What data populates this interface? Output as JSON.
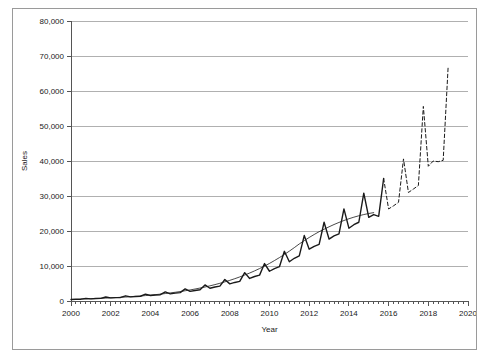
{
  "chart_data": {
    "type": "line",
    "title": "",
    "xlabel": "Year",
    "ylabel": "Sales",
    "xlim": [
      2000,
      2020
    ],
    "ylim": [
      0,
      80000
    ],
    "grid": true,
    "legend_position": "bottom",
    "x_ticks": [
      "2000",
      "2002",
      "2004",
      "2006",
      "2008",
      "2010",
      "2012",
      "2014",
      "2016",
      "2018",
      "2020"
    ],
    "x_tick_values": [
      2000,
      2002,
      2004,
      2006,
      2008,
      2010,
      2012,
      2014,
      2016,
      2018,
      2020
    ],
    "y_ticks": [
      "0",
      "10,000",
      "20,000",
      "30,000",
      "40,000",
      "50,000",
      "60,000",
      "70,000",
      "80,000"
    ],
    "y_tick_values": [
      0,
      10000,
      20000,
      30000,
      40000,
      50000,
      60000,
      70000,
      80000
    ],
    "minor_x_tick_step": 0.25,
    "series": [
      {
        "name": "Sales",
        "style": "solid",
        "width": 1.4,
        "color": "#1a1a1a",
        "x": [
          2000,
          2000.25,
          2000.5,
          2000.75,
          2001,
          2001.25,
          2001.5,
          2001.75,
          2002,
          2002.25,
          2002.5,
          2002.75,
          2003,
          2003.25,
          2003.5,
          2003.75,
          2004,
          2004.25,
          2004.5,
          2004.75,
          2005,
          2005.25,
          2005.5,
          2005.75,
          2006,
          2006.25,
          2006.5,
          2006.75,
          2007,
          2007.25,
          2007.5,
          2007.75,
          2008,
          2008.25,
          2008.5,
          2008.75,
          2009,
          2009.25,
          2009.5,
          2009.75,
          2010,
          2010.25,
          2010.5,
          2010.75,
          2011,
          2011.25,
          2011.5,
          2011.75,
          2012,
          2012.25,
          2012.5,
          2012.75,
          2013,
          2013.25,
          2013.5,
          2013.75,
          2014,
          2014.25,
          2014.5,
          2014.75,
          2015,
          2015.25,
          2015.5,
          2015.75
        ],
        "values": [
          420,
          480,
          520,
          760,
          600,
          700,
          760,
          1150,
          880,
          960,
          1020,
          1480,
          1180,
          1280,
          1360,
          1950,
          1560,
          1700,
          1800,
          2600,
          2050,
          2250,
          2400,
          3450,
          2750,
          3000,
          3200,
          4600,
          3650,
          4000,
          4250,
          6150,
          4900,
          5300,
          5600,
          8100,
          6450,
          7000,
          7400,
          10700,
          8500,
          9250,
          9800,
          14200,
          11200,
          12200,
          12900,
          18700,
          14800,
          15600,
          16200,
          22500,
          17700,
          18600,
          19200,
          26300,
          20800,
          21800,
          22500,
          30800,
          23900,
          24700,
          24200,
          35000
        ]
      },
      {
        "name": "CMA",
        "style": "solid",
        "width": 0.8,
        "color": "#1a1a1a",
        "x": [
          2000.5,
          2000.75,
          2001,
          2001.25,
          2001.5,
          2001.75,
          2002,
          2002.25,
          2002.5,
          2002.75,
          2003,
          2003.25,
          2003.5,
          2003.75,
          2004,
          2004.25,
          2004.5,
          2004.75,
          2005,
          2005.25,
          2005.5,
          2005.75,
          2006,
          2006.25,
          2006.5,
          2006.75,
          2007,
          2007.25,
          2007.5,
          2007.75,
          2008,
          2008.25,
          2008.5,
          2008.75,
          2009,
          2009.25,
          2009.5,
          2009.75,
          2010,
          2010.25,
          2010.5,
          2010.75,
          2011,
          2011.25,
          2011.5,
          2011.75,
          2012,
          2012.25,
          2012.5,
          2012.75,
          2013,
          2013.25,
          2013.5,
          2013.75,
          2014,
          2014.25,
          2014.5,
          2014.75,
          2015,
          2015.25
        ],
        "values": [
          545,
          585,
          645,
          705,
          765,
          830,
          900,
          975,
          1050,
          1130,
          1220,
          1320,
          1430,
          1545,
          1670,
          1810,
          1960,
          2130,
          2310,
          2500,
          2700,
          2920,
          3160,
          3420,
          3700,
          4000,
          4330,
          4680,
          5060,
          5470,
          5900,
          6370,
          6870,
          7410,
          7990,
          8610,
          9270,
          9980,
          10740,
          11550,
          12400,
          13300,
          14250,
          15250,
          16300,
          17250,
          18150,
          19000,
          19800,
          20500,
          21200,
          21850,
          22450,
          23000,
          23500,
          23950,
          24350,
          24700,
          25000,
          25250
        ]
      },
      {
        "name": "Est Sales",
        "style": "dashed",
        "width": 1.0,
        "color": "#1a1a1a",
        "x": [
          2015.75,
          2016,
          2016.25,
          2016.5,
          2016.75,
          2017,
          2017.25,
          2017.5,
          2017.75,
          2018,
          2018.25,
          2018.5,
          2018.75,
          2019
        ],
        "values": [
          35000,
          26300,
          27200,
          28200,
          40600,
          31000,
          32000,
          33000,
          55600,
          38500,
          40000,
          39800,
          40200,
          67000
        ]
      }
    ],
    "annotations": []
  },
  "legend": {
    "items": [
      {
        "label": "Sales",
        "style": "solid",
        "width": 1.4
      },
      {
        "label": "CMA",
        "style": "solid",
        "width": 0.8
      },
      {
        "label": "Est Sales",
        "style": "dashed",
        "width": 1.0
      }
    ]
  },
  "colors": {
    "line": "#1a1a1a",
    "grid": "#b0b0b0",
    "axis": "#555555",
    "border": "#9a9a9a",
    "background": "#ffffff",
    "text": "#1a1a1a"
  }
}
